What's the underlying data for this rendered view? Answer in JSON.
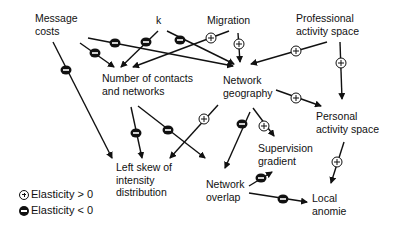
{
  "nodes": {
    "message_costs": "Message\ncosts",
    "k": "k",
    "migration": "Migration",
    "professional_activity_space": "Professional\nactivity space",
    "number_of_contacts": "Number of contacts\nand networks",
    "network_geography": "Network\ngeography",
    "personal_activity_space": "Personal\nactivity space",
    "left_skew": "Left skew of\nintensity\ndistribution",
    "supervision_gradient": "Supervision\ngradient",
    "network_overlap": "Network\noverlap",
    "local_anomie": "Local\nanomie"
  },
  "legend": {
    "positive": "Elasticity > 0",
    "negative": "Elasticity < 0"
  },
  "edges": [
    {
      "from": "Message costs",
      "to": "Left skew of intensity distribution",
      "sign": "-"
    },
    {
      "from": "Message costs",
      "to": "Number of contacts and networks",
      "sign": "-"
    },
    {
      "from": "Message costs",
      "to": "Network geography",
      "sign": "-"
    },
    {
      "from": "k",
      "to": "Number of contacts and networks",
      "sign": "-"
    },
    {
      "from": "k",
      "to": "Network geography",
      "sign": "-"
    },
    {
      "from": "Migration",
      "to": "Number of contacts and networks",
      "sign": "+"
    },
    {
      "from": "Migration",
      "to": "Network geography",
      "sign": "+"
    },
    {
      "from": "Professional activity space",
      "to": "Network geography",
      "sign": "+"
    },
    {
      "from": "Professional activity space",
      "to": "Personal activity space",
      "sign": "+"
    },
    {
      "from": "Network geography",
      "to": "Personal activity space",
      "sign": "+"
    },
    {
      "from": "Number of contacts and networks",
      "to": "Left skew of intensity distribution",
      "sign": "-"
    },
    {
      "from": "Number of contacts and networks",
      "to": "Network overlap",
      "sign": "-"
    },
    {
      "from": "Network geography",
      "to": "Left skew of intensity distribution",
      "sign": "+"
    },
    {
      "from": "Network geography",
      "to": "Network overlap",
      "sign": "-"
    },
    {
      "from": "Network geography",
      "to": "Supervision gradient",
      "sign": "+"
    },
    {
      "from": "Network overlap",
      "to": "Supervision gradient",
      "sign": "-"
    },
    {
      "from": "Network overlap",
      "to": "Local anomie",
      "sign": "-"
    },
    {
      "from": "Personal activity space",
      "to": "Local anomie",
      "sign": "+"
    }
  ]
}
